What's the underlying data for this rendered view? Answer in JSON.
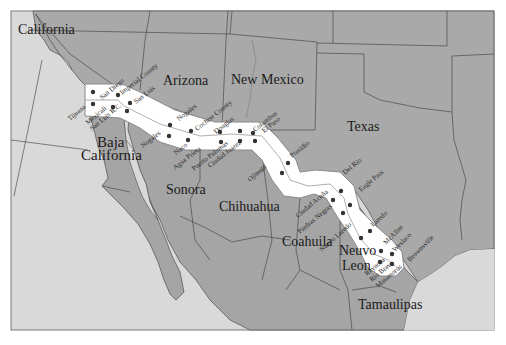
{
  "map": {
    "colors": {
      "page_background": "#ffffff",
      "ocean": "#d9d9d9",
      "us_land": "#a9a9a9",
      "mexico_land": "#a5a5a5",
      "baja_inner": "#b5b5b5",
      "border_lines": "#3a3a3a",
      "corridor_fill": "#ffffff",
      "corridor_edge": "#8a8a8a",
      "centerline": "#9a9a9a",
      "dot": "#333333",
      "frame": "#7a7a7a"
    },
    "state_labels": [
      {
        "name": "California",
        "x": 18,
        "y": 34,
        "size": 14
      },
      {
        "name": "Arizona",
        "x": 163,
        "y": 85,
        "size": 14
      },
      {
        "name": "New Mexico",
        "x": 231,
        "y": 84,
        "size": 14
      },
      {
        "name": "Texas",
        "x": 347,
        "y": 131,
        "size": 14
      },
      {
        "name": "Baja",
        "x": 97,
        "y": 147,
        "size": 15
      },
      {
        "name": "California",
        "x": 81,
        "y": 160,
        "size": 15
      },
      {
        "name": "Sonora",
        "x": 166,
        "y": 194,
        "size": 14
      },
      {
        "name": "Chihuahua",
        "x": 219,
        "y": 211,
        "size": 14
      },
      {
        "name": "Coahuila",
        "x": 282,
        "y": 246,
        "size": 14
      },
      {
        "name": "Neuvo",
        "x": 339,
        "y": 255,
        "size": 14
      },
      {
        "name": "Leon",
        "x": 342,
        "y": 270,
        "size": 14
      },
      {
        "name": "Tamaulipas",
        "x": 358,
        "y": 309,
        "size": 14
      }
    ],
    "city_labels": [
      {
        "name": "San Diego",
        "x": 102,
        "y": 100,
        "rot": -40
      },
      {
        "name": "Imperial County",
        "x": 122,
        "y": 95,
        "rot": -38
      },
      {
        "name": "San Luis",
        "x": 136,
        "y": 104,
        "rot": -38
      },
      {
        "name": "Tijuana",
        "x": 70,
        "y": 121,
        "rot": -40
      },
      {
        "name": "Mexicali",
        "x": 88,
        "y": 125,
        "rot": -40
      },
      {
        "name": "San Luis R.C.",
        "x": 92,
        "y": 131,
        "rot": -40
      },
      {
        "name": "Nogales",
        "x": 179,
        "y": 121,
        "rot": -38
      },
      {
        "name": "Nogales",
        "x": 143,
        "y": 148,
        "rot": -38
      },
      {
        "name": "Cochise County",
        "x": 197,
        "y": 131,
        "rot": -38
      },
      {
        "name": "Douglas",
        "x": 216,
        "y": 134,
        "rot": -38
      },
      {
        "name": "Columbus",
        "x": 255,
        "y": 132,
        "rot": -38
      },
      {
        "name": "El Paso",
        "x": 264,
        "y": 133,
        "rot": -38
      },
      {
        "name": "Naco",
        "x": 176,
        "y": 155,
        "rot": -38
      },
      {
        "name": "Agua Prieta",
        "x": 175,
        "y": 170,
        "rot": -38
      },
      {
        "name": "Puerto Palomas",
        "x": 194,
        "y": 171,
        "rot": -38
      },
      {
        "name": "Ciudad Juarez",
        "x": 210,
        "y": 168,
        "rot": -38
      },
      {
        "name": "Presidio",
        "x": 292,
        "y": 158,
        "rot": -38
      },
      {
        "name": "Ojinaga",
        "x": 250,
        "y": 182,
        "rot": -42
      },
      {
        "name": "Del Rio",
        "x": 345,
        "y": 175,
        "rot": -40
      },
      {
        "name": "Eagle Pass",
        "x": 361,
        "y": 192,
        "rot": -40
      },
      {
        "name": "Ciudad Acuña",
        "x": 298,
        "y": 218,
        "rot": -40
      },
      {
        "name": "Piedras Negras",
        "x": 300,
        "y": 234,
        "rot": -40
      },
      {
        "name": "Laredo",
        "x": 373,
        "y": 227,
        "rot": -42
      },
      {
        "name": "Nuevo Laredo",
        "x": 322,
        "y": 252,
        "rot": -42
      },
      {
        "name": "McAllen",
        "x": 386,
        "y": 245,
        "rot": -45
      },
      {
        "name": "Weslaco",
        "x": 395,
        "y": 252,
        "rot": -45
      },
      {
        "name": "Brownsville",
        "x": 410,
        "y": 262,
        "rot": -45
      },
      {
        "name": "Reynosa",
        "x": 367,
        "y": 276,
        "rot": -40
      },
      {
        "name": "Rio Bravo",
        "x": 372,
        "y": 282,
        "rot": -40
      },
      {
        "name": "Matamoros",
        "x": 378,
        "y": 288,
        "rot": -40
      }
    ],
    "dots": [
      [
        93,
        92
      ],
      [
        118,
        95
      ],
      [
        93,
        104
      ],
      [
        113,
        107
      ],
      [
        130,
        103
      ],
      [
        127,
        111
      ],
      [
        170,
        125
      ],
      [
        191,
        131
      ],
      [
        169,
        136
      ],
      [
        188,
        140
      ],
      [
        220,
        132
      ],
      [
        240,
        131
      ],
      [
        221,
        142
      ],
      [
        240,
        141
      ],
      [
        253,
        133
      ],
      [
        255,
        141
      ],
      [
        288,
        163
      ],
      [
        282,
        173
      ],
      [
        341,
        191
      ],
      [
        333,
        200
      ],
      [
        350,
        205
      ],
      [
        343,
        213
      ],
      [
        370,
        231
      ],
      [
        361,
        238
      ],
      [
        381,
        251
      ],
      [
        392,
        254
      ],
      [
        380,
        262
      ],
      [
        392,
        264
      ]
    ]
  }
}
